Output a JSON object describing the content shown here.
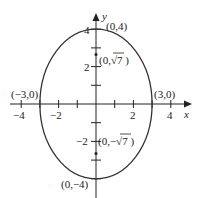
{
  "diagram": {
    "type": "ellipse-graph",
    "equation_params": {
      "a": 3,
      "b": 4
    },
    "axes": {
      "x_label": "x",
      "y_label": "y",
      "x_ticks": [
        {
          "value": -4,
          "label": "−4"
        },
        {
          "value": -3,
          "label": ""
        },
        {
          "value": -2,
          "label": "−2"
        },
        {
          "value": -1,
          "label": ""
        },
        {
          "value": 1,
          "label": ""
        },
        {
          "value": 2,
          "label": "2"
        },
        {
          "value": 3,
          "label": ""
        },
        {
          "value": 4,
          "label": "4"
        }
      ],
      "y_ticks": [
        {
          "value": 4,
          "label": "4"
        },
        {
          "value": 3,
          "label": ""
        },
        {
          "value": 2,
          "label": "2"
        },
        {
          "value": 1,
          "label": ""
        },
        {
          "value": -1,
          "label": ""
        },
        {
          "value": -2,
          "label": "−2"
        },
        {
          "value": -3,
          "label": ""
        },
        {
          "value": -4,
          "label": "−4"
        }
      ]
    },
    "points": {
      "top_vertex": "(0,4)",
      "bottom_vertex": "(0,−4)",
      "left_vertex": "(−3,0)",
      "right_vertex": "(3,0)",
      "focus_top": "(0,√7 )",
      "focus_bottom": "(0,−√7 )"
    },
    "tick_labels": {
      "x_neg4": "−4",
      "x_neg2": "−2",
      "x_2": "2",
      "x_4": "4",
      "y_4": "4",
      "y_2": "2",
      "y_neg2": "−2",
      "y_neg4": "−4"
    }
  }
}
